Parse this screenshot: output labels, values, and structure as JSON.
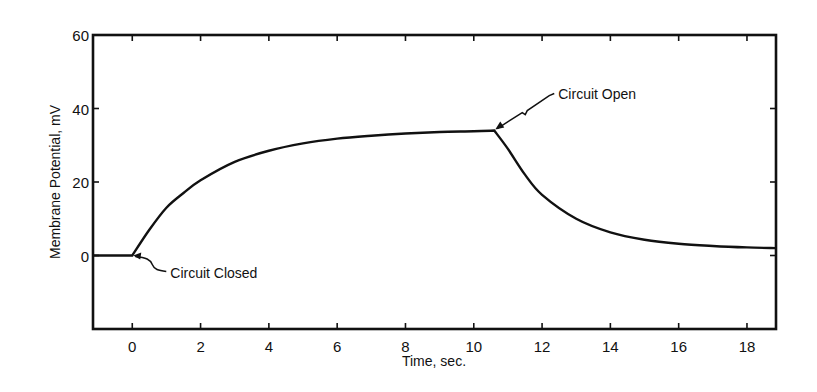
{
  "chart_data": {
    "type": "line",
    "title": "",
    "xlabel": "Time, sec.",
    "ylabel": "Membrane Potential, mV",
    "xlim": [
      -1.15,
      18.85
    ],
    "ylim": [
      -20,
      60
    ],
    "x_ticks": [
      0,
      2,
      4,
      6,
      8,
      10,
      12,
      14,
      16,
      18
    ],
    "x_tick_labels": [
      "0",
      "2",
      "4",
      "6",
      "8",
      "10",
      "12",
      "14",
      "16",
      "18"
    ],
    "y_ticks": [
      0,
      20,
      40,
      60
    ],
    "y_tick_labels": [
      "0",
      "20",
      "40",
      "60"
    ],
    "grid": false,
    "legend": null,
    "series": [
      {
        "name": "Membrane potential",
        "x": [
          -1.15,
          0,
          0.5,
          1,
          1.5,
          2,
          3,
          4,
          5,
          6,
          7,
          8,
          9,
          10,
          10.6,
          11,
          11.5,
          12,
          13,
          14,
          15,
          16,
          17,
          18,
          18.85
        ],
        "y": [
          0,
          0,
          7,
          13,
          17,
          20.5,
          25.5,
          28.5,
          30.5,
          31.8,
          32.6,
          33.2,
          33.6,
          33.8,
          34,
          29,
          22,
          16.5,
          10,
          6.3,
          4.3,
          3.2,
          2.6,
          2.2,
          2
        ]
      }
    ],
    "annotations": [
      {
        "text": "Circuit Closed",
        "x": 0,
        "y": 0
      },
      {
        "text": "Circuit Open",
        "x": 10.6,
        "y": 34
      }
    ]
  }
}
